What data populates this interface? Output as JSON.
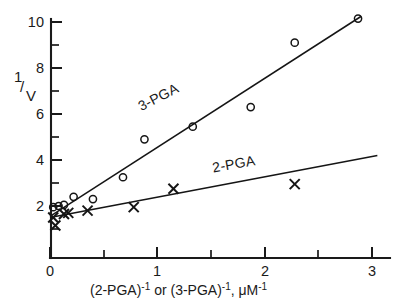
{
  "figure": {
    "background_color": "#ffffff",
    "ink_color": "#1a1a1a"
  },
  "axes": {
    "y_axis_label_numerator": "1",
    "y_axis_label_slash": "/",
    "y_axis_label_denominator": "V",
    "y_tick_labels": [
      "10",
      "8",
      "6",
      "4",
      "2"
    ],
    "x_tick_labels": [
      "0",
      "1",
      "2",
      "3"
    ],
    "x_axis_label_part1": "(2-PGA)",
    "x_axis_label_sup1": "-1",
    "x_axis_label_conj": " or ",
    "x_axis_label_part2": "(3-PGA)",
    "x_axis_label_sup2": "-1",
    "x_axis_label_comma": ", ",
    "x_axis_label_unit": "μM",
    "x_axis_label_sup3": "-1"
  },
  "series_labels": {
    "upper": "3-PGA",
    "lower": "2-PGA"
  },
  "chart_data": {
    "type": "scatter",
    "title": "",
    "subtitle": "",
    "xlabel": "(2-PGA)^-1 or (3-PGA)^-1, μM^-1",
    "ylabel": "1/V",
    "xlim": [
      0,
      3.15
    ],
    "ylim": [
      0,
      10.6
    ],
    "x_ticks": [
      0,
      1,
      2,
      3
    ],
    "x_minor_ticks": [
      0.5,
      1.5,
      2.5
    ],
    "y_ticks": [
      2,
      4,
      6,
      8,
      10
    ],
    "y_minor_ticks": [
      1,
      3,
      5,
      7,
      9
    ],
    "grid": false,
    "legend": "inline-annotations",
    "annotations": [
      {
        "text": "3-PGA",
        "x": 1.03,
        "y": 6.55,
        "rotation": -27
      },
      {
        "text": "2-PGA",
        "x": 1.72,
        "y": 3.62,
        "rotation": -10
      }
    ],
    "series": [
      {
        "name": "3-PGA",
        "marker": "open-circle",
        "points": [
          {
            "x": 0.03,
            "y": 1.95
          },
          {
            "x": 0.08,
            "y": 2.0
          },
          {
            "x": 0.13,
            "y": 2.05
          },
          {
            "x": 0.22,
            "y": 2.4
          },
          {
            "x": 0.4,
            "y": 2.3
          },
          {
            "x": 0.68,
            "y": 3.25
          },
          {
            "x": 0.88,
            "y": 4.9
          },
          {
            "x": 1.33,
            "y": 5.45
          },
          {
            "x": 1.87,
            "y": 6.3
          },
          {
            "x": 2.28,
            "y": 9.1
          },
          {
            "x": 2.87,
            "y": 10.15
          }
        ],
        "fit_line": {
          "x_start": 0.0,
          "y_start": 1.55,
          "x_end": 2.9,
          "y_end": 10.25
        }
      },
      {
        "name": "2-PGA",
        "marker": "cross",
        "points": [
          {
            "x": 0.03,
            "y": 1.5
          },
          {
            "x": 0.05,
            "y": 1.15
          },
          {
            "x": 0.13,
            "y": 1.65
          },
          {
            "x": 0.17,
            "y": 1.7
          },
          {
            "x": 0.35,
            "y": 1.8
          },
          {
            "x": 0.78,
            "y": 1.95
          },
          {
            "x": 1.15,
            "y": 2.75
          },
          {
            "x": 2.28,
            "y": 2.95
          }
        ],
        "fit_line": {
          "x_start": 0.0,
          "y_start": 1.5,
          "x_end": 3.05,
          "y_end": 4.2
        }
      }
    ]
  }
}
